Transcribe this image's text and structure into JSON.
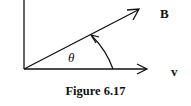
{
  "figure": {
    "caption": "Figure 6.17",
    "labels": {
      "vector_b": "B",
      "vector_v": "v",
      "angle": "θ"
    },
    "colors": {
      "stroke": "#111111",
      "background": "#ffffff"
    }
  }
}
